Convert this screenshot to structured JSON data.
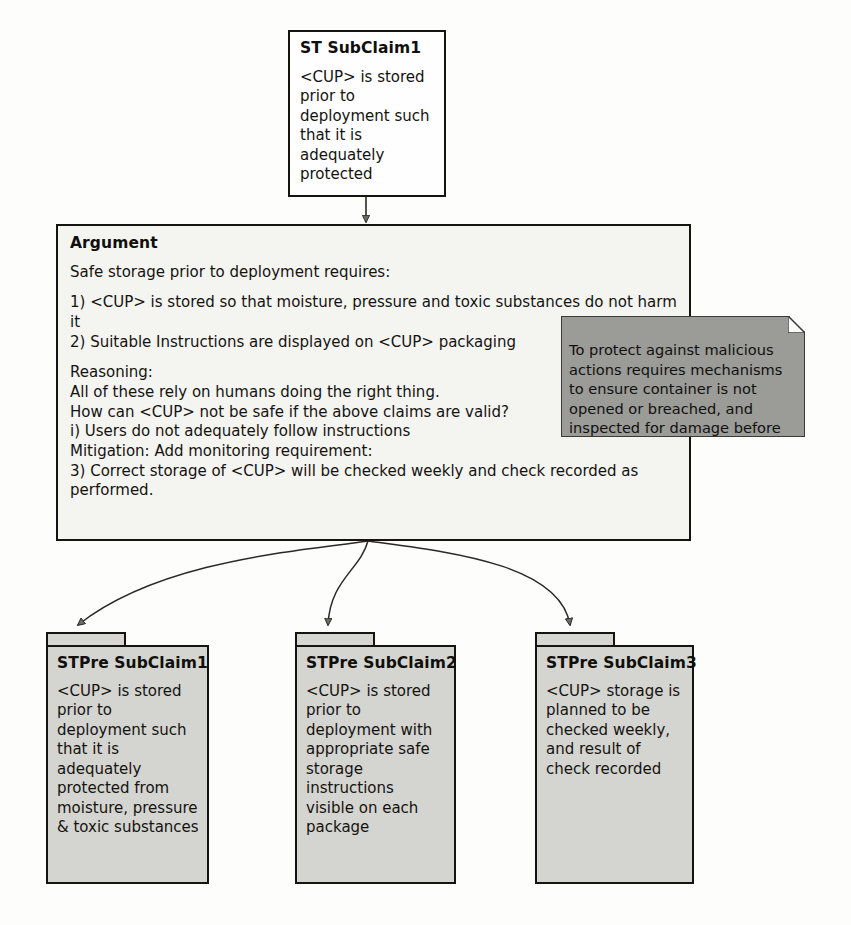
{
  "diagram": {
    "type": "assurance-case-argument-diagram",
    "background_color": "#fdfdfb",
    "line_color": "#15140f"
  },
  "nodes": {
    "st_subclaim1": {
      "title": "ST SubClaim1",
      "body": "<CUP> is stored prior to deployment such that it is adequately protected"
    },
    "argument": {
      "title": "Argument",
      "intro": "Safe storage prior to deployment requires:",
      "requirements": "1) <CUP> is stored so that moisture, pressure and toxic substances do not harm it\n2) Suitable Instructions are displayed on <CUP> packaging",
      "reasoning": "Reasoning:\nAll of these rely on humans doing the right thing.\nHow can <CUP> not be safe if the above claims are valid?\ni) Users do not adequately follow instructions\nMitigation: Add monitoring requirement:\n3) Correct storage of <CUP> will be checked weekly and check recorded as performed."
    },
    "note": {
      "text": "To protect against malicious actions requires mechanisms to ensure container is not opened or breached, and inspected for damage before deployment",
      "fill_color": "#9b9b97"
    },
    "packages": [
      {
        "title": "STPre SubClaim1",
        "body": "<CUP> is stored prior to deployment such that it is adequately protected from moisture, pressure & toxic substances"
      },
      {
        "title": "STPre SubClaim2",
        "body": "<CUP> is stored prior to deployment with appropriate safe storage instructions visible on each package"
      },
      {
        "title": "STPre SubClaim3",
        "body": "<CUP> storage is planned to be checked weekly, and result of check recorded"
      }
    ]
  },
  "edges": [
    {
      "name": "st-subclaim1-to-argument",
      "from": "st_subclaim1",
      "to": "argument",
      "style": "straight-arrow"
    },
    {
      "name": "argument-to-stpre-subclaim1",
      "from": "argument",
      "to": "packages.0",
      "style": "curved-arrow"
    },
    {
      "name": "argument-to-stpre-subclaim2",
      "from": "argument",
      "to": "packages.1",
      "style": "curved-arrow"
    },
    {
      "name": "argument-to-stpre-subclaim3",
      "from": "argument",
      "to": "packages.2",
      "style": "curved-arrow"
    }
  ]
}
